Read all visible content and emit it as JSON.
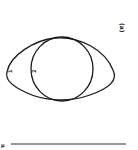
{
  "figure": {
    "panel_label": "(a)",
    "curve_labels": [
      "1",
      "2"
    ],
    "scale_bar_label": "μ",
    "colors": {
      "stroke": "#1a1a1a",
      "background": "#ffffff"
    }
  }
}
